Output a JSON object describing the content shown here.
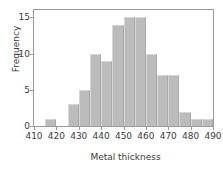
{
  "chart_data": {
    "type": "bar",
    "title": "",
    "xlabel": "Metal thickness",
    "ylabel": "Frequency",
    "xlim": [
      410,
      490
    ],
    "ylim": [
      0,
      16
    ],
    "bin_width": 5,
    "grid": false,
    "legend": null,
    "bar_color": "#bcbcbc",
    "axis_color": "#9a9a9a",
    "text_color": "#3c3c3c",
    "xticks": [
      410,
      420,
      430,
      440,
      450,
      460,
      470,
      480,
      490
    ],
    "xtick_labels": [
      "410",
      "420",
      "430",
      "440",
      "450",
      "460",
      "470",
      "480",
      "490"
    ],
    "yticks": [
      0,
      5,
      10,
      15
    ],
    "ytick_labels": [
      "0",
      "5",
      "10",
      "15"
    ],
    "bin_edges": [
      410,
      415,
      420,
      425,
      430,
      435,
      440,
      445,
      450,
      455,
      460,
      465,
      470,
      475,
      480,
      485,
      490
    ],
    "categories": [
      "410-415",
      "415-420",
      "420-425",
      "425-430",
      "430-435",
      "435-440",
      "440-445",
      "445-450",
      "450-455",
      "455-460",
      "460-465",
      "465-470",
      "470-475",
      "475-480",
      "480-485",
      "485-490"
    ],
    "values": [
      0,
      1,
      0,
      3,
      5,
      10,
      9,
      14,
      15,
      15,
      10,
      7,
      7,
      2,
      1,
      1
    ]
  }
}
